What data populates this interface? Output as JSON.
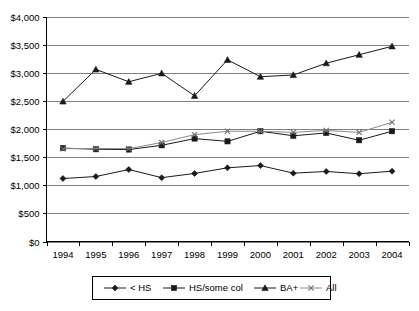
{
  "chart_data": {
    "type": "line",
    "title": "",
    "subtitle": "",
    "xlabel": "",
    "ylabel": "",
    "grid": true,
    "legend_position": "bottom",
    "categories": [
      "1994",
      "1995",
      "1996",
      "1997",
      "1998",
      "1999",
      "2000",
      "2001",
      "2002",
      "2003",
      "2004"
    ],
    "x": [
      1994,
      1995,
      1996,
      1997,
      1998,
      1999,
      2000,
      2001,
      2002,
      2003,
      2004
    ],
    "ylim": [
      0,
      4000
    ],
    "ytick_values": [
      0,
      500,
      1000,
      1500,
      2000,
      2500,
      3000,
      3500,
      4000
    ],
    "ytick_labels": [
      "$0",
      "$500",
      "$1,000",
      "$1,500",
      "$2,000",
      "$2,500",
      "$3,000",
      "$3,500",
      "$4,000"
    ],
    "series": [
      {
        "name": "< HS",
        "marker": "diamond",
        "color": "#1a1a1a",
        "values": [
          1120,
          1155,
          1280,
          1135,
          1210,
          1310,
          1350,
          1215,
          1245,
          1205,
          1250
        ]
      },
      {
        "name": "HS/some col",
        "marker": "square",
        "color": "#1a1a1a",
        "values": [
          1660,
          1640,
          1635,
          1710,
          1830,
          1780,
          1960,
          1880,
          1930,
          1800,
          1960
        ]
      },
      {
        "name": "BA+",
        "marker": "triangle",
        "color": "#1a1a1a",
        "values": [
          2490,
          3060,
          2840,
          2990,
          2590,
          3230,
          2930,
          2960,
          3170,
          3320,
          3470
        ]
      },
      {
        "name": "All",
        "marker": "x",
        "color": "#6e6e6e",
        "values": [
          1650,
          1655,
          1650,
          1760,
          1900,
          1960,
          1960,
          1940,
          1975,
          1940,
          2120
        ]
      }
    ]
  },
  "legend": {
    "items": [
      {
        "label": "< HS",
        "marker": "diamond"
      },
      {
        "label": "HS/some col",
        "marker": "square"
      },
      {
        "label": "BA+",
        "marker": "triangle"
      },
      {
        "label": "All",
        "marker": "x"
      }
    ]
  }
}
